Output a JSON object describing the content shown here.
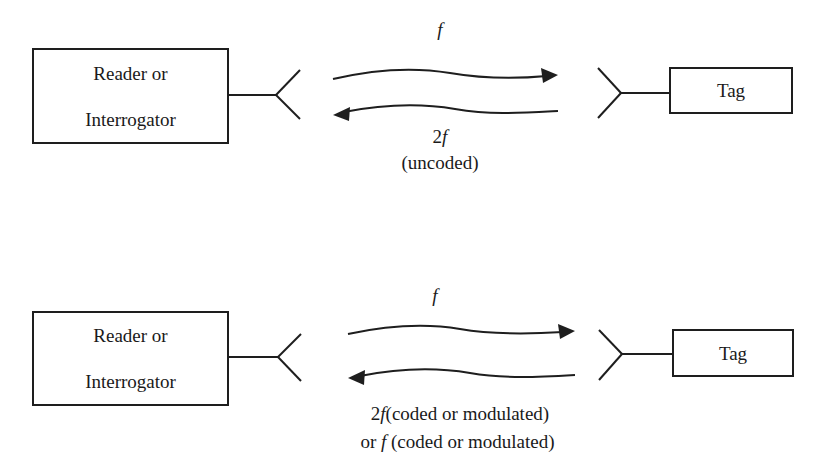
{
  "diagrams": [
    {
      "id": "uncoded",
      "reader": {
        "label_line1": "Reader or",
        "label_line2": "Interrogator"
      },
      "tag": {
        "label": "Tag"
      },
      "forward_signal": {
        "label": "f"
      },
      "return_signal": {
        "label_freq": "2f",
        "label_note": "(uncoded)"
      }
    },
    {
      "id": "coded",
      "reader": {
        "label_line1": "Reader or",
        "label_line2": "Interrogator"
      },
      "tag": {
        "label": "Tag"
      },
      "forward_signal": {
        "label": "f"
      },
      "return_signal": {
        "line1_freq": "2f",
        "line1_note": "(coded or modulated)",
        "line2_prefix": "or ",
        "line2_freq": "f",
        "line2_note": " (coded or modulated)"
      }
    }
  ],
  "colors": {
    "stroke": "#1e1e1e",
    "background": "#ffffff"
  }
}
